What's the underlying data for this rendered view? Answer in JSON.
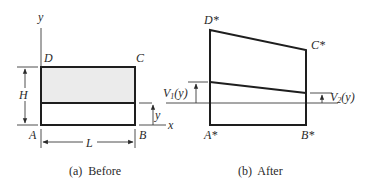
{
  "colors": {
    "line": "#1e1e1e",
    "thin_line": "#3a3a3a",
    "shade": "#ebebeb",
    "background": "#ffffff"
  },
  "panel_before": {
    "caption": "(a)  Before",
    "axis_y_label": "y",
    "axis_x_label": "x",
    "corner_a": "A",
    "corner_b": "B",
    "corner_c": "C",
    "corner_d": "D",
    "height_label": "H",
    "length_label": "L",
    "position_label": "y"
  },
  "panel_after": {
    "caption": "(b)  After",
    "corner_a": "A*",
    "corner_b": "B*",
    "corner_c": "C*",
    "corner_d": "D*",
    "v1": {
      "base": "V",
      "sub": "1",
      "arg": "(y)"
    },
    "v2": {
      "base": "V",
      "sub": "2",
      "arg": "(y)"
    }
  }
}
